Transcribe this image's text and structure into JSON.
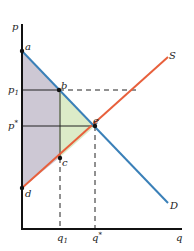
{
  "diagram": {
    "axes": {
      "y_label": "p",
      "x_label": "q"
    },
    "curves": {
      "supply": {
        "label": "S",
        "color": "#e8603c"
      },
      "demand": {
        "label": "D",
        "color": "#3a80b8"
      }
    },
    "points": {
      "a": "a",
      "b": "b",
      "c": "c",
      "d": "d",
      "e": "e"
    },
    "price_labels": {
      "p1": "p",
      "p1_sub": "1",
      "pstar": "p",
      "pstar_sup": "*"
    },
    "quantity_labels": {
      "q1": "q",
      "q1_sub": "1",
      "qstar": "q",
      "qstar_sup": "*"
    },
    "regions": {
      "surplus_gray": {
        "color": "#cdc8d4"
      },
      "deadweight_green": {
        "color": "#dcebc8"
      }
    }
  }
}
